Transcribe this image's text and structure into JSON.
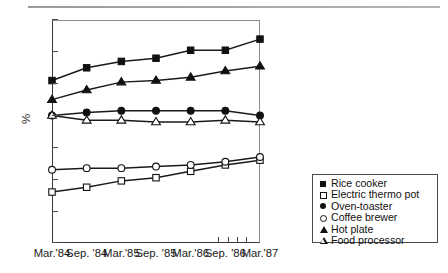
{
  "chart_data": {
    "type": "line",
    "title": "",
    "xlabel": "",
    "ylabel": "%",
    "ylim": [
      0,
      70
    ],
    "ytick_values": [
      0,
      10,
      20,
      30,
      40,
      50,
      60,
      70
    ],
    "ytick_labels": [
      "0",
      "10",
      "20",
      "30",
      "40",
      "50",
      "60",
      "70"
    ],
    "grid": false,
    "legend_position": "outside-right-bottom",
    "categories": [
      "Mar.'84",
      "Sep. '84",
      "Mar.'85",
      "Sep. '85",
      "Mar.'86",
      "Sep. '86",
      "Mar.'87"
    ],
    "series": [
      {
        "name": "Rice cooker",
        "marker": "square-filled",
        "values": [
          51,
          55,
          57,
          58,
          60.5,
          60.5,
          64
        ]
      },
      {
        "name": "Electric thermo pot",
        "marker": "square-open",
        "values": [
          16,
          17.5,
          19.5,
          20.5,
          22.5,
          24.5,
          26
        ]
      },
      {
        "name": "Oven-toaster",
        "marker": "circle-filled",
        "values": [
          40,
          41,
          41.5,
          41.5,
          41.5,
          41.5,
          40
        ]
      },
      {
        "name": "Coffee brewer",
        "marker": "circle-open",
        "values": [
          23,
          23.5,
          23.5,
          24,
          24.5,
          25.5,
          27
        ]
      },
      {
        "name": "Hot plate",
        "marker": "triangle-filled",
        "values": [
          45,
          48,
          50.5,
          51,
          52,
          54,
          55.5
        ]
      },
      {
        "name": "Food processor",
        "marker": "triangle-open",
        "values": [
          40,
          38.5,
          38.5,
          38,
          38,
          38.5,
          38
        ]
      }
    ]
  },
  "legend": {
    "items": [
      {
        "label": "Rice cooker",
        "marker": "square-filled"
      },
      {
        "label": "Electric thermo pot",
        "marker": "square-open"
      },
      {
        "label": "Oven-toaster",
        "marker": "circle-filled"
      },
      {
        "label": "Coffee brewer",
        "marker": "circle-open"
      },
      {
        "label": "Hot plate",
        "marker": "triangle-filled"
      },
      {
        "label": "Food processor",
        "marker": "triangle-open"
      }
    ]
  },
  "colors": {
    "line": "#1a1a1a",
    "axis": "#3a3a3a",
    "frame_light": "#8d8d8d",
    "background": "#ffffff"
  },
  "extra_ticks_note": "4 short unlabeled ticks between Sep. '86 and Mar.'87 on the x-axis"
}
